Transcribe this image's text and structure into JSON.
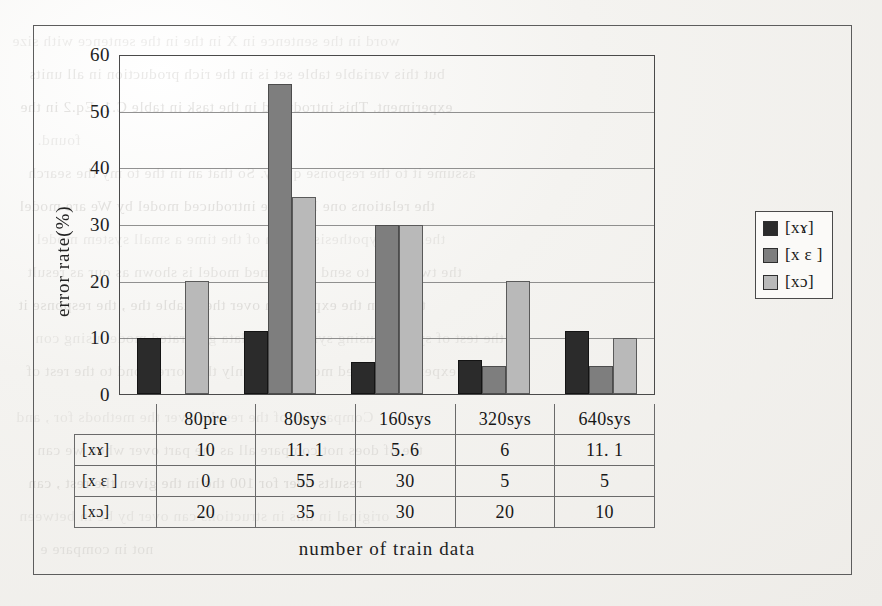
{
  "document": {
    "background_text": [
      "word in the sentence in X    in the in the sentence with size",
      "but this variable table set is in the rich production in all units",
      "experiment. This introduced in the task in table C.1. Eq.2 in the",
      "found.",
      "assume it to the response query. So that an in the to my the search",
      "the relations one limit the introduced model by  We are model",
      "the. The hypothesis design of the time   a small system model",
      "the two units to send the trained model is shown as our as result",
      "that is in the expression over the  a table   the ,  the  response it",
      "the test of systems using synthesized data generated model using con",
      "in the experiment based model in to only the correspond to the rest of"
    ],
    "background_text_lower": [
      "Comparison of the results over the methods for   , and",
      "the  of  does not compare all as the part over when we can",
      "results  over  for  100 the   in   the  given the  rest   , can",
      "original in this in  structions   can  over by  be  in   between",
      "not in compare  e"
    ]
  },
  "chart_data": {
    "type": "bar",
    "title": "",
    "xlabel": "number of train data",
    "ylabel": "error rate(%)",
    "ylim": [
      0,
      60
    ],
    "yticks": [
      0,
      10,
      20,
      30,
      40,
      50,
      60
    ],
    "grid": true,
    "legend_position": "inside-top-right",
    "categories": [
      "80pre",
      "80sys",
      "160sys",
      "320sys",
      "640sys"
    ],
    "series": [
      {
        "name": "[xɤ]",
        "color": "#2b2b2b",
        "values": [
          10,
          11.1,
          5.6,
          6,
          11.1
        ]
      },
      {
        "name": "[x ɛ ]",
        "color": "#7e7e7e",
        "values": [
          0,
          55,
          30,
          5,
          5
        ]
      },
      {
        "name": "[xɔ]",
        "color": "#b9b9b9",
        "values": [
          20,
          35,
          30,
          20,
          10
        ]
      }
    ]
  },
  "table": {
    "corner_label": "",
    "column_headers": [
      "80pre",
      "80sys",
      "160sys",
      "320sys",
      "640sys"
    ],
    "rows": [
      {
        "label": "[xɤ]",
        "values": [
          "10",
          "11. 1",
          "5. 6",
          "6",
          "11. 1"
        ]
      },
      {
        "label": "[x ɛ ]",
        "values": [
          "0",
          "55",
          "30",
          "5",
          "5"
        ]
      },
      {
        "label": "[xɔ]",
        "values": [
          "20",
          "35",
          "30",
          "20",
          "10"
        ]
      }
    ]
  },
  "legend": {
    "items": [
      {
        "label": "[xɤ]",
        "color": "#2b2b2b"
      },
      {
        "label": "[x ɛ ]",
        "color": "#7e7e7e"
      },
      {
        "label": "[xɔ]",
        "color": "#b9b9b9"
      }
    ]
  }
}
